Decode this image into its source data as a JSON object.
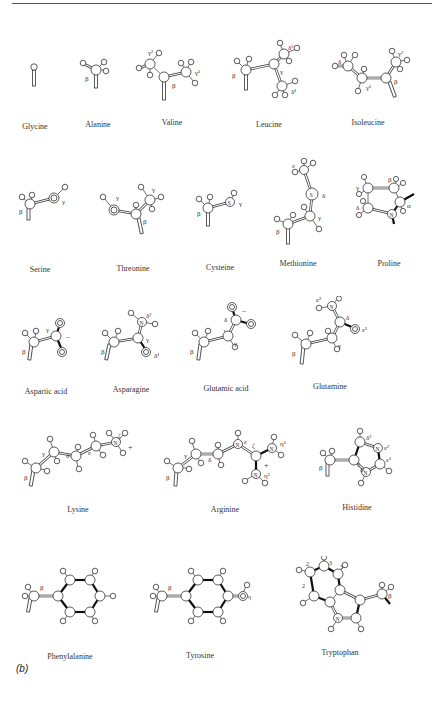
{
  "figure": {
    "panel_label": "(b)",
    "rows": [
      {
        "molecules": [
          {
            "name": "Glycine",
            "labels": []
          },
          {
            "name": "Alanine",
            "labels": [
              "β"
            ]
          },
          {
            "name": "Valine",
            "labels": [
              "γ²",
              "β",
              "γ¹"
            ]
          },
          {
            "name": "Leucine",
            "labels": [
              "β",
              "γ",
              "δ²",
              "δ¹"
            ]
          },
          {
            "name": "Isoleucine",
            "labels": [
              "δ",
              "γ¹",
              "β",
              "γ²"
            ]
          }
        ]
      },
      {
        "molecules": [
          {
            "name": "Serine",
            "labels": [
              "β",
              "γ"
            ]
          },
          {
            "name": "Threonine",
            "labels": [
              "γ",
              "β",
              "γ"
            ]
          },
          {
            "name": "Cysteine",
            "labels": [
              "β",
              "γ"
            ]
          },
          {
            "name": "Methionine",
            "labels": [
              "ε",
              "δ",
              "γ",
              "β"
            ]
          },
          {
            "name": "Proline",
            "labels": [
              "γ",
              "β",
              "δ",
              "α"
            ]
          }
        ]
      },
      {
        "molecules": [
          {
            "name": "Aspartic acid",
            "labels": [
              "β",
              "γ",
              "−"
            ]
          },
          {
            "name": "Asparagine",
            "labels": [
              "β",
              "γ",
              "δ²",
              "δ¹"
            ]
          },
          {
            "name": "Glutamic acid",
            "labels": [
              "β",
              "γ",
              "δ",
              "−"
            ]
          },
          {
            "name": "Glutamine",
            "labels": [
              "β",
              "γ",
              "δ",
              "ε²",
              "ε¹"
            ]
          }
        ]
      },
      {
        "molecules": [
          {
            "name": "Lysine",
            "labels": [
              "β",
              "γ",
              "δ",
              "ε",
              "ζ",
              "+"
            ]
          },
          {
            "name": "Arginine",
            "labels": [
              "β",
              "γ",
              "δ",
              "ε",
              "ζ",
              "η¹",
              "η²",
              "+"
            ]
          },
          {
            "name": "Histidine",
            "labels": [
              "β",
              "γ",
              "δ²",
              "ε²",
              "ε¹",
              "δ¹"
            ]
          }
        ]
      },
      {
        "molecules": [
          {
            "name": "Phenylalanine",
            "labels": [
              "β"
            ]
          },
          {
            "name": "Tyrosine",
            "labels": [
              "β",
              "η"
            ]
          },
          {
            "name": "Tryptophan",
            "labels": [
              "β",
              "2",
              "3",
              "3",
              "2"
            ]
          }
        ]
      }
    ],
    "atom_symbols": {
      "oxygen": "O",
      "nitrogen": "N",
      "sulfur": "S"
    }
  }
}
